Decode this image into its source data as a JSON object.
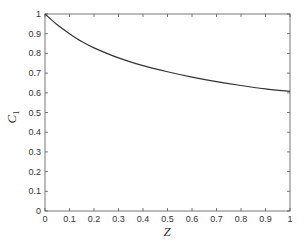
{
  "chart_data": {
    "type": "line",
    "title": "",
    "xlabel": "Z",
    "ylabel": "C",
    "ylabel_subscript": "1",
    "xlim": [
      0,
      1
    ],
    "ylim": [
      0,
      1
    ],
    "grid": false,
    "legend": null,
    "xticks": [
      "0",
      "0.1",
      "0.2",
      "0.3",
      "0.4",
      "0.5",
      "0.6",
      "0.7",
      "0.8",
      "0.9",
      "1"
    ],
    "yticks": [
      "0",
      "0.1",
      "0.2",
      "0.3",
      "0.4",
      "0.5",
      "0.6",
      "0.7",
      "0.8",
      "0.9",
      "1"
    ],
    "series": [
      {
        "name": "C1",
        "color": "#333333",
        "x": [
          0,
          0.05,
          0.1,
          0.15,
          0.2,
          0.3,
          0.4,
          0.5,
          0.6,
          0.7,
          0.8,
          0.9,
          1.0
        ],
        "values": [
          1.0,
          0.945,
          0.9,
          0.86,
          0.828,
          0.777,
          0.738,
          0.707,
          0.68,
          0.657,
          0.637,
          0.62,
          0.607
        ]
      }
    ]
  }
}
